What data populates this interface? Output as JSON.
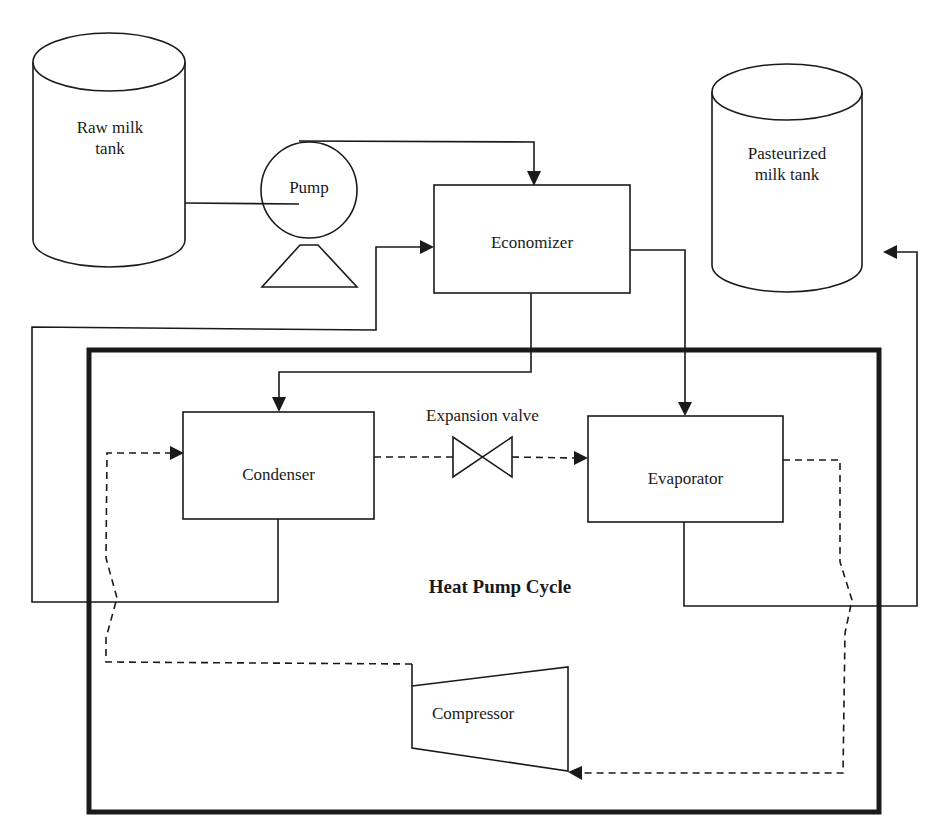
{
  "diagram": {
    "title": "Heat Pump Cycle",
    "components": {
      "raw_tank": "Raw milk tank",
      "raw_tank_l1": "Raw milk",
      "raw_tank_l2": "tank",
      "pump": "Pump",
      "economizer": "Economizer",
      "past_tank_l1": "Pasteurized",
      "past_tank_l2": "milk tank",
      "condenser": "Condenser",
      "expansion_valve": "Expansion valve",
      "evaporator": "Evaporator",
      "compressor": "Compressor"
    },
    "colors": {
      "line": "#1a1a1a",
      "background": "#ffffff"
    },
    "flows": [
      {
        "from": "Raw milk tank",
        "to": "Pump",
        "style": "solid"
      },
      {
        "from": "Pump",
        "to": "Economizer",
        "style": "solid"
      },
      {
        "from": "Economizer",
        "to": "Condenser",
        "style": "solid"
      },
      {
        "from": "Condenser",
        "to": "Economizer",
        "style": "solid"
      },
      {
        "from": "Economizer",
        "to": "Evaporator",
        "style": "solid"
      },
      {
        "from": "Evaporator",
        "to": "Pasteurized milk tank",
        "style": "solid"
      },
      {
        "from": "Condenser",
        "to": "Expansion valve",
        "style": "dashed"
      },
      {
        "from": "Expansion valve",
        "to": "Evaporator",
        "style": "dashed"
      },
      {
        "from": "Evaporator",
        "to": "Compressor",
        "style": "dashed"
      },
      {
        "from": "Compressor",
        "to": "Condenser",
        "style": "dashed"
      }
    ]
  }
}
